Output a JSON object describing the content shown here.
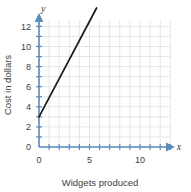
{
  "chart_data": {
    "type": "line",
    "title": "",
    "xlabel": "Widgets produced",
    "ylabel": "Cost in dollars",
    "x_axis_symbol": "x",
    "y_axis_symbol": "y",
    "xlim": [
      0,
      13
    ],
    "ylim": [
      0,
      12.6
    ],
    "x_tick_step": 1,
    "y_tick_step": 1,
    "x_tick_labels": [
      {
        "value": 0,
        "text": "0"
      },
      {
        "value": 5,
        "text": "5"
      },
      {
        "value": 10,
        "text": "10"
      }
    ],
    "y_tick_labels": [
      {
        "value": 0,
        "text": "0"
      },
      {
        "value": 2,
        "text": "2"
      },
      {
        "value": 4,
        "text": "4"
      },
      {
        "value": 6,
        "text": "6"
      },
      {
        "value": 8,
        "text": "8"
      },
      {
        "value": 10,
        "text": "10"
      },
      {
        "value": 12,
        "text": "12"
      }
    ],
    "grid": true,
    "legend": false,
    "series": [
      {
        "name": "cost",
        "slope": 1.9,
        "intercept": 3,
        "x": [
          0,
          5.7
        ],
        "y": [
          3,
          13.83
        ],
        "points": [
          {
            "x": 0,
            "y": 3
          },
          {
            "x": 1,
            "y": 4.9
          },
          {
            "x": 2,
            "y": 6.8
          },
          {
            "x": 3,
            "y": 8.7
          },
          {
            "x": 4,
            "y": 10.6
          },
          {
            "x": 5,
            "y": 12.5
          }
        ]
      }
    ],
    "colors": {
      "line": "#1a1a1a",
      "axis": "#5b8cb8",
      "grid": "#e6e6e6",
      "text": "#3d3d3d",
      "background": "#ffffff"
    }
  }
}
